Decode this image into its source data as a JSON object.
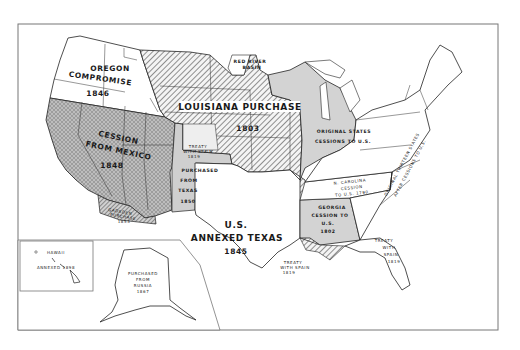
{
  "map": {
    "title": "Territorial Growth of the United States",
    "colors": {
      "paper": "#ffffff",
      "ink": "#2a2a2a",
      "cession_fill": "#c9c9c9",
      "gray_fill": "#d3d3d3",
      "hatch": "#3a3a3a"
    },
    "regions": {
      "oregon": {
        "line1": "OREGON",
        "line2": "COMPROMISE",
        "year": "1846"
      },
      "louisiana": {
        "line1": "LOUISIANA",
        "line2": "PURCHASE",
        "year": "1803"
      },
      "red_river": {
        "line1": "RED RIVER",
        "line2": "BASIN"
      },
      "mexico": {
        "line1": "CESSION",
        "line2": "FROM MEXICO",
        "year": "1848"
      },
      "treaty_spain_north": {
        "line1": "TREATY",
        "line2": "WITH SPAIN",
        "year": "1819"
      },
      "purchased_texas": {
        "line1": "PURCHASED",
        "line2": "FROM",
        "line3": "TEXAS",
        "year": "1850"
      },
      "gadsden": {
        "line1": "GADSDEN",
        "line2": "PURCHASE",
        "year": "1853"
      },
      "texas": {
        "line1": "U.S.",
        "line2": "ANNEXED TEXAS",
        "year": "1845"
      },
      "original": {
        "line1": "ORIGINAL STATES",
        "line2": "CESSIONS TO U.S."
      },
      "ncarolina": {
        "line1": "N. CAROLINA",
        "line2": "CESSION",
        "line3": "TO U.S. 1790"
      },
      "georgia": {
        "line1": "GEORGIA",
        "line2": "CESSION TO",
        "line3": "U.S.",
        "year": "1802"
      },
      "original_after": {
        "line1": "ORIGINAL THIRTEEN STATES",
        "line2": "AFTER CESSIONS TO U.S."
      },
      "treaty_spain_florida": {
        "line1": "TREATY",
        "line2": "WITH",
        "line3": "SPAIN",
        "year": "1819"
      },
      "treaty_spain_gulf": {
        "line1": "TREATY",
        "line2": "WITH SPAIN",
        "year": "1819"
      },
      "hawaii": {
        "line1": "HAWAII",
        "line2": "ANNEXED 1898"
      },
      "alaska": {
        "line1": "PURCHASED",
        "line2": "FROM",
        "line3": "RUSSIA",
        "year": "1867"
      }
    }
  }
}
